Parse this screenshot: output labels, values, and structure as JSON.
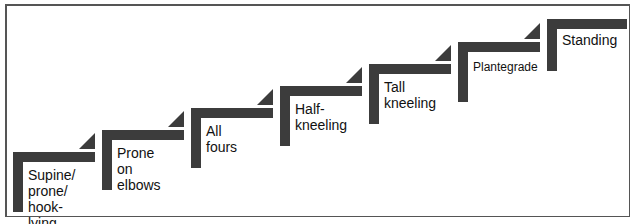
{
  "diagram": {
    "title": "",
    "type": "staircase progression",
    "colors": {
      "step": "#3c3c3c",
      "border": "#555555",
      "text": "#111111",
      "background": "#ffffff"
    },
    "steps": [
      {
        "label": "Supine/\nprone/\nhook-lying"
      },
      {
        "label": "Prone on\nelbows"
      },
      {
        "label": "All fours"
      },
      {
        "label": "Half-\nkneeling"
      },
      {
        "label": "Tall\nkneeling"
      },
      {
        "label": "Plantegrade"
      },
      {
        "label": "Standing"
      }
    ]
  }
}
